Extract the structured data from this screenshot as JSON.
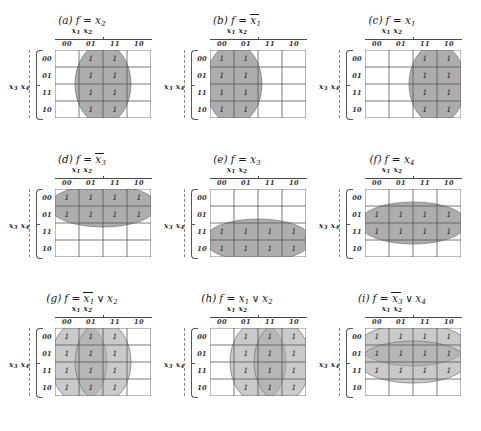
{
  "figure": {
    "grid_columns": [
      "00",
      "01",
      "11",
      "10"
    ],
    "grid_rows": [
      "00",
      "01",
      "11",
      "10"
    ],
    "column_variable_label": "x1 x2",
    "row_variable_label": "x3 x4",
    "one_glyph": "1",
    "shade_color": "#a9a9a9",
    "line_color": "#555555",
    "panels": [
      {
        "tag": "(a)",
        "function_text": "f = x2",
        "function_terms": [
          {
            "bar": false,
            "v": "x",
            "sub": "2"
          }
        ],
        "ones_columns": [
          "01",
          "11"
        ],
        "ones_rows": [
          "00",
          "01",
          "11",
          "10"
        ],
        "cells": [
          [
            "",
            "1",
            "1",
            ""
          ],
          [
            "",
            "1",
            "1",
            ""
          ],
          [
            "",
            "1",
            "1",
            ""
          ],
          [
            "",
            "1",
            "1",
            ""
          ]
        ],
        "groups": [
          {
            "orientation": "vertical",
            "col_start": 1,
            "col_span": 2,
            "row_start": 0,
            "row_span": 4
          }
        ]
      },
      {
        "tag": "(b)",
        "function_text": "f = x̄1",
        "function_terms": [
          {
            "bar": true,
            "v": "x",
            "sub": "1"
          }
        ],
        "ones_columns": [
          "00",
          "01"
        ],
        "ones_rows": [
          "00",
          "01",
          "11",
          "10"
        ],
        "cells": [
          [
            "1",
            "1",
            "",
            ""
          ],
          [
            "1",
            "1",
            "",
            ""
          ],
          [
            "1",
            "1",
            "",
            ""
          ],
          [
            "1",
            "1",
            "",
            ""
          ]
        ],
        "groups": [
          {
            "orientation": "vertical",
            "col_start": 0,
            "col_span": 2,
            "row_start": 0,
            "row_span": 4
          }
        ]
      },
      {
        "tag": "(c)",
        "function_text": "f = x1",
        "function_terms": [
          {
            "bar": false,
            "v": "x",
            "sub": "1"
          }
        ],
        "ones_columns": [
          "11",
          "10"
        ],
        "ones_rows": [
          "00",
          "01",
          "11",
          "10"
        ],
        "cells": [
          [
            "",
            "",
            "1",
            "1"
          ],
          [
            "",
            "",
            "1",
            "1"
          ],
          [
            "",
            "",
            "1",
            "1"
          ],
          [
            "",
            "",
            "1",
            "1"
          ]
        ],
        "groups": [
          {
            "orientation": "vertical",
            "col_start": 2,
            "col_span": 2,
            "row_start": 0,
            "row_span": 4
          }
        ]
      },
      {
        "tag": "(d)",
        "function_text": "f = x̄3",
        "function_terms": [
          {
            "bar": true,
            "v": "x",
            "sub": "3"
          }
        ],
        "ones_columns": [
          "00",
          "01",
          "11",
          "10"
        ],
        "ones_rows": [
          "00",
          "01"
        ],
        "cells": [
          [
            "1",
            "1",
            "1",
            "1"
          ],
          [
            "1",
            "1",
            "1",
            "1"
          ],
          [
            "",
            "",
            "",
            ""
          ],
          [
            "",
            "",
            "",
            ""
          ]
        ],
        "groups": [
          {
            "orientation": "horizontal",
            "col_start": 0,
            "col_span": 4,
            "row_start": 0,
            "row_span": 2
          }
        ]
      },
      {
        "tag": "(e)",
        "function_text": "f = x3",
        "function_terms": [
          {
            "bar": false,
            "v": "x",
            "sub": "3"
          }
        ],
        "ones_columns": [
          "00",
          "01",
          "11",
          "10"
        ],
        "ones_rows": [
          "11",
          "10"
        ],
        "cells": [
          [
            "",
            "",
            "",
            ""
          ],
          [
            "",
            "",
            "",
            ""
          ],
          [
            "1",
            "1",
            "1",
            "1"
          ],
          [
            "1",
            "1",
            "1",
            "1"
          ]
        ],
        "groups": [
          {
            "orientation": "horizontal",
            "col_start": 0,
            "col_span": 4,
            "row_start": 2,
            "row_span": 2
          }
        ]
      },
      {
        "tag": "(f)",
        "function_text": "f = x4",
        "function_terms": [
          {
            "bar": false,
            "v": "x",
            "sub": "4"
          }
        ],
        "ones_columns": [
          "00",
          "01",
          "11",
          "10"
        ],
        "ones_rows": [
          "01",
          "11"
        ],
        "cells": [
          [
            "",
            "",
            "",
            ""
          ],
          [
            "1",
            "1",
            "1",
            "1"
          ],
          [
            "1",
            "1",
            "1",
            "1"
          ],
          [
            "",
            "",
            "",
            ""
          ]
        ],
        "groups": [
          {
            "orientation": "horizontal",
            "col_start": 0,
            "col_span": 4,
            "row_start": 1,
            "row_span": 2
          }
        ]
      },
      {
        "tag": "(g)",
        "function_text": "f = x̄1 ∨ x2",
        "function_terms": [
          {
            "bar": true,
            "v": "x",
            "sub": "1"
          },
          {
            "op": "∨"
          },
          {
            "bar": false,
            "v": "x",
            "sub": "2"
          }
        ],
        "ones_columns": [
          "00",
          "01",
          "11"
        ],
        "ones_rows": [
          "00",
          "01",
          "11",
          "10"
        ],
        "cells": [
          [
            "1",
            "1",
            "1",
            ""
          ],
          [
            "1",
            "1",
            "1",
            ""
          ],
          [
            "1",
            "1",
            "1",
            ""
          ],
          [
            "1",
            "1",
            "1",
            ""
          ]
        ],
        "groups": [
          {
            "orientation": "vertical",
            "col_start": 0,
            "col_span": 2,
            "row_start": 0,
            "row_span": 4
          },
          {
            "orientation": "vertical",
            "col_start": 1,
            "col_span": 2,
            "row_start": 0,
            "row_span": 4
          }
        ]
      },
      {
        "tag": "(h)",
        "function_text": "f = x1 ∨ x2",
        "function_terms": [
          {
            "bar": false,
            "v": "x",
            "sub": "1"
          },
          {
            "op": "∨"
          },
          {
            "bar": false,
            "v": "x",
            "sub": "2"
          }
        ],
        "ones_columns": [
          "01",
          "11",
          "10"
        ],
        "ones_rows": [
          "00",
          "01",
          "11",
          "10"
        ],
        "cells": [
          [
            "",
            "1",
            "1",
            "1"
          ],
          [
            "",
            "1",
            "1",
            "1"
          ],
          [
            "",
            "1",
            "1",
            "1"
          ],
          [
            "",
            "1",
            "1",
            "1"
          ]
        ],
        "groups": [
          {
            "orientation": "vertical",
            "col_start": 1,
            "col_span": 2,
            "row_start": 0,
            "row_span": 4
          },
          {
            "orientation": "vertical",
            "col_start": 2,
            "col_span": 2,
            "row_start": 0,
            "row_span": 4
          }
        ]
      },
      {
        "tag": "(i)",
        "function_text": "f = x̄3 ∨ x4",
        "function_terms": [
          {
            "bar": true,
            "v": "x",
            "sub": "3"
          },
          {
            "op": "∨"
          },
          {
            "bar": false,
            "v": "x",
            "sub": "4"
          }
        ],
        "ones_columns": [
          "00",
          "01",
          "11",
          "10"
        ],
        "ones_rows": [
          "00",
          "01",
          "11"
        ],
        "cells": [
          [
            "1",
            "1",
            "1",
            "1"
          ],
          [
            "1",
            "1",
            "1",
            "1"
          ],
          [
            "1",
            "1",
            "1",
            "1"
          ],
          [
            "",
            "",
            "",
            ""
          ]
        ],
        "groups": [
          {
            "orientation": "horizontal",
            "col_start": 0,
            "col_span": 4,
            "row_start": 0,
            "row_span": 2
          },
          {
            "orientation": "horizontal",
            "col_start": 0,
            "col_span": 4,
            "row_start": 1,
            "row_span": 2
          }
        ]
      }
    ]
  }
}
